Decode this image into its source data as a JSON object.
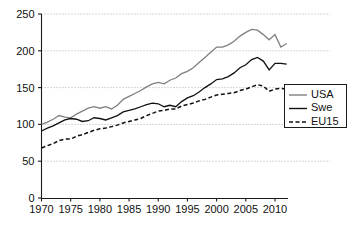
{
  "chart_data": {
    "type": "line",
    "title": "",
    "xlabel": "",
    "ylabel": "",
    "xlim": [
      1970,
      2012
    ],
    "ylim": [
      0,
      250
    ],
    "grid": true,
    "legend_position": "right",
    "xticks": [
      1970,
      1975,
      1980,
      1985,
      1990,
      1995,
      2000,
      2005,
      2010
    ],
    "yticks": [
      0,
      50,
      100,
      150,
      200,
      250
    ],
    "x": [
      1970,
      1971,
      1972,
      1973,
      1974,
      1975,
      1976,
      1977,
      1978,
      1979,
      1980,
      1981,
      1982,
      1983,
      1984,
      1985,
      1986,
      1987,
      1988,
      1989,
      1990,
      1991,
      1992,
      1993,
      1994,
      1995,
      1996,
      1997,
      1998,
      1999,
      2000,
      2001,
      2002,
      2003,
      2004,
      2005,
      2006,
      2007,
      2008,
      2009,
      2010,
      2011,
      2012
    ],
    "series": [
      {
        "name": "USA",
        "color": "#808080",
        "style": "solid",
        "values": [
          100,
          103,
          107,
          112,
          110,
          109,
          114,
          118,
          122,
          124,
          122,
          124,
          121,
          126,
          134,
          138,
          142,
          146,
          151,
          155,
          157,
          155,
          160,
          163,
          169,
          172,
          177,
          184,
          191,
          198,
          205,
          205,
          208,
          213,
          220,
          225,
          229,
          228,
          222,
          215,
          222,
          205,
          210
        ]
      },
      {
        "name": "Swe",
        "color": "#111111",
        "style": "solid",
        "values": [
          91,
          95,
          98,
          102,
          106,
          108,
          107,
          104,
          105,
          109,
          108,
          106,
          109,
          112,
          117,
          119,
          121,
          124,
          127,
          129,
          128,
          124,
          126,
          124,
          131,
          136,
          139,
          144,
          150,
          155,
          161,
          162,
          165,
          170,
          177,
          181,
          188,
          191,
          186,
          174,
          183,
          183,
          182
        ]
      },
      {
        "name": "EU15",
        "color": "#111111",
        "style": "dashed",
        "values": [
          68,
          71,
          74,
          78,
          80,
          80,
          84,
          86,
          89,
          92,
          94,
          95,
          97,
          99,
          102,
          104,
          106,
          108,
          112,
          115,
          118,
          119,
          121,
          121,
          125,
          127,
          129,
          132,
          134,
          137,
          140,
          141,
          142,
          143,
          146,
          148,
          151,
          154,
          152,
          145,
          148,
          149,
          148
        ]
      }
    ]
  },
  "legend": {
    "entries": [
      {
        "label": "USA"
      },
      {
        "label": "Swe"
      },
      {
        "label": "EU15"
      }
    ]
  }
}
